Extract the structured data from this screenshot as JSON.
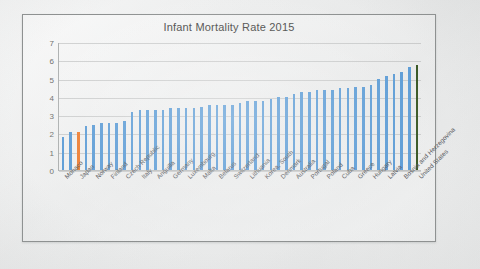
{
  "chart_data": {
    "type": "bar",
    "title": "Infant Mortality Rate 2015",
    "xlabel": "",
    "ylabel": "",
    "ylim": [
      0,
      7
    ],
    "yticks": [
      0,
      1,
      2,
      3,
      4,
      5,
      6,
      7
    ],
    "grid": true,
    "legend": "none",
    "label_rotation": -45,
    "labels_shown": "every-other-category",
    "series_name": "Infant Mortality Rate 2015",
    "categories": [
      "Monaco",
      "Iceland",
      "Japan",
      "Singapore",
      "Norway",
      "Sweden",
      "Finland",
      "Bermuda",
      "Czech Republic",
      "Hong Kong",
      "Italy",
      "Spain",
      "Anguilla",
      "Macau",
      "Germany",
      "France",
      "Luxembourg",
      "Andorra",
      "Malta",
      "Austria",
      "Belarus",
      "Ireland",
      "Switzerland",
      "Israel",
      "Lithuania",
      "Belgium",
      "Korea, South",
      "Netherlands",
      "Denmark",
      "Slovenia",
      "Australia",
      "New Zealand",
      "Portugal",
      "United Kingdom",
      "Poland",
      "Estonia",
      "Cuba",
      "Canada",
      "Greece",
      "Croatia",
      "Hungary",
      "Slovakia",
      "Latvia",
      "Serbia",
      "Bosnia and Herzegovina",
      "Montenegro",
      "United States"
    ],
    "values": [
      1.8,
      2.1,
      2.1,
      2.4,
      2.5,
      2.6,
      2.6,
      2.6,
      2.7,
      3.2,
      3.3,
      3.3,
      3.3,
      3.3,
      3.4,
      3.4,
      3.4,
      3.4,
      3.5,
      3.6,
      3.6,
      3.6,
      3.6,
      3.7,
      3.8,
      3.8,
      3.8,
      3.9,
      4.0,
      4.0,
      4.2,
      4.3,
      4.3,
      4.4,
      4.4,
      4.4,
      4.5,
      4.5,
      4.6,
      4.6,
      4.7,
      5.0,
      5.2,
      5.3,
      5.4,
      5.7,
      5.8
    ],
    "visible_tick_labels": [
      "Monaco",
      "Japan",
      "Norway",
      "Finland",
      "Czech Republic",
      "Italy",
      "Anguilla",
      "Germany",
      "Luxembourg",
      "Malta",
      "Belarus",
      "Switzerland",
      "Lithuania",
      "Korea, South",
      "Denmark",
      "Australia",
      "Portugal",
      "Poland",
      "Cuba",
      "Greece",
      "Hungary",
      "Latvia",
      "Bosnia and Herzegovina",
      "United States"
    ],
    "bar_colors": {
      "default": "#5B9BD5",
      "highlight_orange": "#ED7D31",
      "highlight_green": "#375623"
    },
    "highlighted": [
      {
        "category": "Japan",
        "color": "#ED7D31",
        "value": 2.1
      },
      {
        "category": "United States",
        "color": "#375623",
        "value": 5.8
      }
    ]
  },
  "colors": {
    "frame_border": "#8d9090",
    "gridline": "#b0b3b3",
    "tick_text": "#6e6f6d",
    "title_text": "#4a4a48",
    "label_text": "#54565a",
    "page_background": "#e9eaea"
  }
}
